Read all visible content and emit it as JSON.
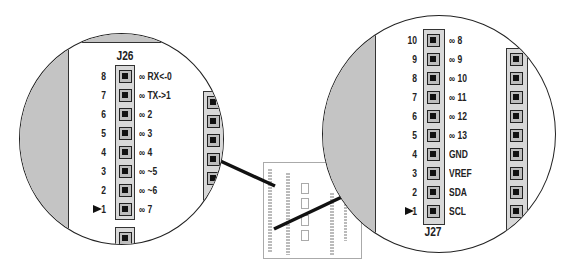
{
  "left_detail": {
    "header_name": "J26",
    "pins": [
      {
        "number": "8",
        "label": "∞ RX<-0"
      },
      {
        "number": "7",
        "label": "∞ TX->1"
      },
      {
        "number": "6",
        "label": "∞ 2"
      },
      {
        "number": "5",
        "label": "∞ 3"
      },
      {
        "number": "4",
        "label": "∞ 4"
      },
      {
        "number": "3",
        "label": "∞ ~5"
      },
      {
        "number": "2",
        "label": "∞ ~6"
      },
      {
        "number": "1",
        "label": "∞ 7"
      }
    ],
    "pin1_marker": "arrow-right"
  },
  "right_detail": {
    "header_name": "J27",
    "pins": [
      {
        "number": "10",
        "label": "∞ 8"
      },
      {
        "number": "9",
        "label": "∞ 9"
      },
      {
        "number": "8",
        "label": "∞ 10"
      },
      {
        "number": "7",
        "label": "∞ 11"
      },
      {
        "number": "6",
        "label": "∞ 12"
      },
      {
        "number": "5",
        "label": "∞ 13"
      },
      {
        "number": "4",
        "label": "GND"
      },
      {
        "number": "3",
        "label": "VREF"
      },
      {
        "number": "2",
        "label": "SDA"
      },
      {
        "number": "1",
        "label": "SCL"
      }
    ],
    "pin1_marker": "arrow-right"
  },
  "board_thumbnail": {
    "description": "Board overview with two highlighted header regions"
  },
  "colors": {
    "outline": "#222222",
    "board_gray": "#c4c4c4",
    "header_fill": "#d8d8d8",
    "pin_center": "#111111"
  }
}
